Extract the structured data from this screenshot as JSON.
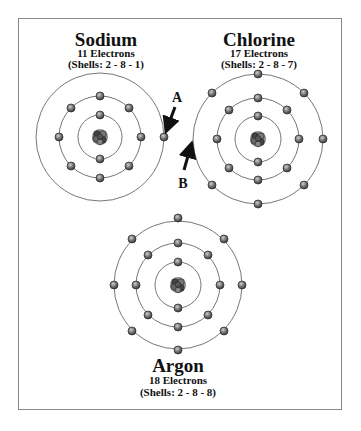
{
  "atoms": [
    {
      "name": "Sodium",
      "electrons_label": "11 Electrons",
      "shells_label": "(Shells: 2 - 8 - 1)",
      "shells": [
        2,
        8,
        1
      ]
    },
    {
      "name": "Chlorine",
      "electrons_label": "17 Electrons",
      "shells_label": "(Shells: 2 - 8 - 7)",
      "shells": [
        2,
        8,
        7
      ]
    },
    {
      "name": "Argon",
      "electrons_label": "18 Electrons",
      "shells_label": "(Shells: 2 - 8 - 8)",
      "shells": [
        2,
        8,
        8
      ]
    }
  ],
  "arrows": [
    {
      "label": "A"
    },
    {
      "label": "B"
    }
  ],
  "colors": {
    "orbit": "#777777",
    "electron": "#6a6a6a",
    "electron_outline": "#333333",
    "nucleus": "#555555",
    "text": "#111111"
  }
}
